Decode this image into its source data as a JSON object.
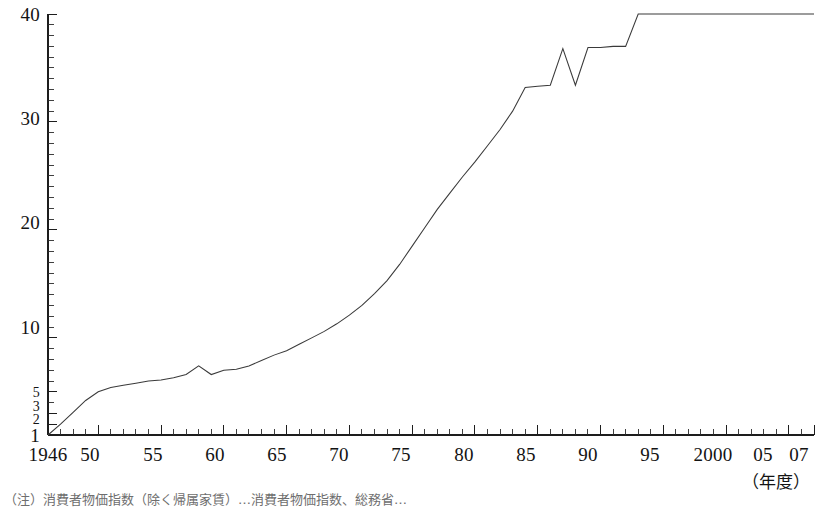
{
  "chart_data": {
    "type": "line",
    "title": "",
    "subtitle": "",
    "xlabel": "（年度）",
    "ylabel": "",
    "xlim": [
      1946,
      2007
    ],
    "ylim": [
      1,
      40
    ],
    "grid": false,
    "legend": null,
    "y_axis": {
      "major_ticks": [
        1,
        2,
        3,
        5,
        10,
        20,
        30,
        40
      ],
      "labels": [
        "1",
        "2",
        "3",
        "5",
        "10",
        "20",
        "30",
        "40"
      ],
      "minor_tick_interval": 1,
      "scale": "linear-compressed"
    },
    "x_axis": {
      "major_ticks": [
        1946,
        1950,
        1955,
        1960,
        1965,
        1970,
        1975,
        1980,
        1985,
        1990,
        1995,
        2000,
        2005,
        2007
      ],
      "labels": [
        "1946",
        "50",
        "55",
        "60",
        "65",
        "70",
        "75",
        "80",
        "85",
        "90",
        "95",
        "2000",
        "05",
        "07"
      ],
      "minor_tick_interval": 1
    },
    "series": [
      {
        "name": "series-1",
        "color": "#3a3a3a",
        "x": [
          1946,
          1947,
          1948,
          1949,
          1950,
          1951,
          1952,
          1953,
          1954,
          1955,
          1956,
          1957,
          1958,
          1959,
          1960,
          1961,
          1962,
          1963,
          1964,
          1965,
          1966,
          1967,
          1968,
          1969,
          1970,
          1971,
          1972,
          1973,
          1974,
          1975,
          1976,
          1977,
          1978,
          1979,
          1980,
          1981,
          1982,
          1983,
          1984,
          1985,
          1986,
          1987,
          1988,
          1989,
          1990,
          1991,
          1992,
          1993,
          1994,
          1995,
          1996,
          1997,
          1998,
          1999,
          2000,
          2001,
          2002,
          2003,
          2004,
          2005,
          2006,
          2007
        ],
        "y": [
          1.0,
          2.0,
          3.1,
          4.2,
          5.0,
          5.4,
          5.6,
          5.8,
          6.0,
          6.1,
          6.3,
          6.6,
          7.4,
          6.6,
          7.0,
          7.1,
          7.4,
          7.9,
          8.4,
          8.8,
          9.4,
          10.0,
          10.6,
          11.3,
          12.1,
          13.0,
          14.1,
          15.3,
          16.8,
          18.5,
          20.2,
          21.9,
          23.4,
          24.9,
          26.3,
          27.8,
          29.3,
          31.0,
          33.2,
          33.3,
          33.4,
          36.8,
          33.4,
          36.9,
          36.9,
          37.0,
          37.0,
          40.0,
          40.0,
          40.0,
          40.0,
          40.0,
          40.0,
          40.0,
          40.0,
          40.0,
          40.0,
          40.0,
          40.0,
          40.0,
          40.0,
          40.0
        ],
        "notes": [
          {
            "year": 1958,
            "type": "dip",
            "description": "small dip"
          },
          {
            "year": 1987,
            "type": "dip",
            "description": "sharp V dip"
          },
          {
            "year": 1992,
            "type": "dip",
            "description": "sharp V dip before plateau at 40"
          }
        ]
      }
    ]
  },
  "footnote": {
    "text": "（注）消費者物価指数（除く帰属家賃）…消費者物価指数、総務省…"
  }
}
